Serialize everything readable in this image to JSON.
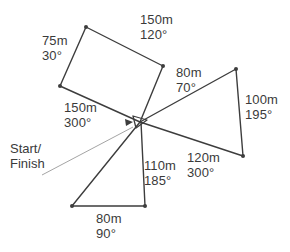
{
  "diagram": {
    "start_marker": {
      "name": "start-finish-marker",
      "label_line_1": "Start/",
      "label_line_2": "Finish"
    },
    "colors": {
      "route_line": "#3d3d3d",
      "leader_line": "#9a9a9a",
      "text": "#3a3a3a",
      "background": "#ffffff",
      "vertex": "#3d3d3d"
    },
    "legs": [
      {
        "id": "leg-150m-120",
        "distance": "150m",
        "bearing": "120°",
        "label_x": 140,
        "label_y": 12
      },
      {
        "id": "leg-75m-30",
        "distance": "75m",
        "bearing": "30°",
        "label_x": 42,
        "label_y": 33
      },
      {
        "id": "leg-80m-70",
        "distance": "80m",
        "bearing": "70°",
        "label_x": 176,
        "label_y": 65
      },
      {
        "id": "leg-100m-195",
        "distance": "100m",
        "bearing": "195°",
        "label_x": 245,
        "label_y": 92
      },
      {
        "id": "leg-150m-300",
        "distance": "150m",
        "bearing": "300°",
        "label_x": 64,
        "label_y": 100
      },
      {
        "id": "leg-120m-300",
        "distance": "120m",
        "bearing": "300°",
        "label_x": 187,
        "label_y": 150
      },
      {
        "id": "leg-110m-185",
        "distance": "110m",
        "bearing": "185°",
        "label_x": 144,
        "label_y": 158
      },
      {
        "id": "leg-80m-90",
        "distance": "80m",
        "bearing": "90°",
        "label_x": 96,
        "label_y": 211
      }
    ],
    "start_label_pos": {
      "x": 10,
      "y": 141
    },
    "geometry": {
      "center": {
        "x": 140,
        "y": 122
      },
      "quad": [
        {
          "x": 140,
          "y": 122
        },
        {
          "x": 86,
          "y": 27
        },
        {
          "x": 163,
          "y": 66
        },
        {
          "x": 60,
          "y": 86
        }
      ],
      "right_triangle": [
        {
          "x": 140,
          "y": 122
        },
        {
          "x": 236,
          "y": 69
        },
        {
          "x": 243,
          "y": 156
        }
      ],
      "bottom_triangle": [
        {
          "x": 140,
          "y": 122
        },
        {
          "x": 72,
          "y": 206
        },
        {
          "x": 145,
          "y": 206
        }
      ],
      "leader_line": {
        "x1": 42,
        "y1": 175,
        "x2": 133,
        "y2": 127
      }
    }
  }
}
